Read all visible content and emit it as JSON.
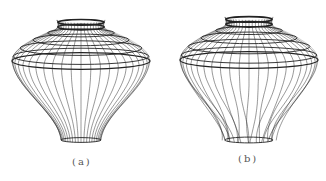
{
  "figures": [
    {
      "id": "a",
      "caption": "(a)",
      "description": "Wireframe mesh of a vase/balloon-shaped surface of revolution with smooth, regular vertical meridians",
      "geometry": {
        "cx": 81,
        "top_y": 20,
        "equator_y": 61,
        "equator_rx": 69,
        "neck_y": 140,
        "neck_rx": 20,
        "meridians": 44,
        "parallels": [
          22,
          28,
          35,
          43,
          52,
          59,
          63
        ]
      }
    },
    {
      "id": "b",
      "caption": "(b)",
      "description": "Deformed wireframe mesh of the same surface with irregular, crossing meridians in the lower part",
      "geometry": {
        "cx": 86,
        "top_y": 17,
        "equator_y": 60,
        "equator_rx": 69,
        "neck_y": 140,
        "neck_rx": 24,
        "meridians": 44,
        "parallels": [
          19,
          25,
          33,
          41,
          50,
          56,
          61
        ]
      }
    }
  ],
  "colors": {
    "line": "#222222",
    "background": "#ffffff",
    "caption": "#555555"
  }
}
